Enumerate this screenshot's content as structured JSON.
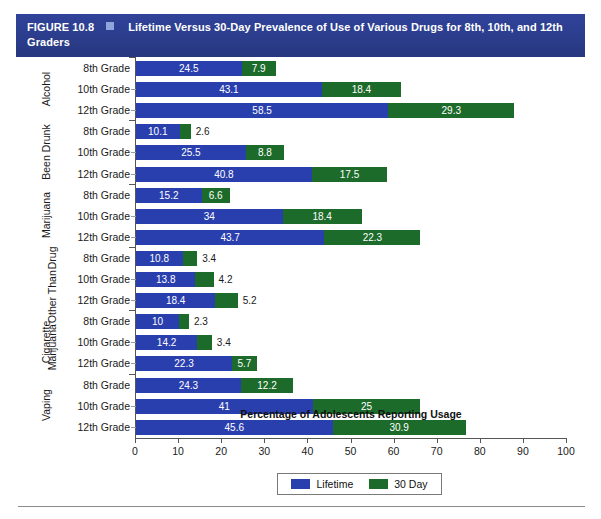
{
  "figure": {
    "number_label": "FIGURE 10.8",
    "title": "Lifetime Versus 30-Day Prevalence of Use of Various Drugs for 8th, 10th, and 12th Graders",
    "header_color": "#2c3f8f",
    "marker_icon": "square-bullet-icon"
  },
  "legend": {
    "position": "bottom-center",
    "items": [
      {
        "label": "Lifetime",
        "color": "#2a3fae"
      },
      {
        "label": "30 Day",
        "color": "#1d6b2a"
      }
    ]
  },
  "axis": {
    "x_title": "Percentage of Adolescents Reporting Usage",
    "x_ticks": [
      "0",
      "10",
      "20",
      "30",
      "40",
      "50",
      "60",
      "70",
      "80",
      "90",
      "100"
    ],
    "x_min": 0,
    "x_max": 100
  },
  "groups": [
    {
      "name": "Alcohol"
    },
    {
      "name": "Been Drunk"
    },
    {
      "name": "Marijuana"
    },
    {
      "name": "Drug Other Than Marijuana",
      "line1": "Drug",
      "line2": "Other Than",
      "line3": "Marijuana"
    },
    {
      "name": "Cigarette"
    },
    {
      "name": "Vaping"
    }
  ],
  "chart_data": {
    "type": "bar",
    "orientation": "horizontal",
    "stacked": true,
    "title": "Lifetime Versus 30-Day Prevalence of Use of Various Drugs for 8th, 10th, and 12th Graders",
    "xlabel": "Percentage of Adolescents Reporting Usage",
    "ylabel": "",
    "xlim": [
      0,
      100
    ],
    "xticks": [
      0,
      10,
      20,
      30,
      40,
      50,
      60,
      70,
      80,
      90,
      100
    ],
    "grid": false,
    "legend": [
      "Lifetime",
      "30 Day"
    ],
    "legend_position": "bottom-center",
    "series": [
      {
        "name": "Lifetime",
        "color": "#2a3fae"
      },
      {
        "name": "30 Day",
        "color": "#1d6b2a"
      }
    ],
    "groups": [
      {
        "group": "Alcohol",
        "rows": [
          {
            "category": "8th Grade",
            "lifetime": 24.5,
            "thirty_day": 7.9
          },
          {
            "category": "10th Grade",
            "lifetime": 43.1,
            "thirty_day": 18.4
          },
          {
            "category": "12th Grade",
            "lifetime": 58.5,
            "thirty_day": 29.3
          }
        ]
      },
      {
        "group": "Been Drunk",
        "rows": [
          {
            "category": "8th Grade",
            "lifetime": 10.1,
            "thirty_day": 2.6
          },
          {
            "category": "10th Grade",
            "lifetime": 25.5,
            "thirty_day": 8.8
          },
          {
            "category": "12th Grade",
            "lifetime": 40.8,
            "thirty_day": 17.5
          }
        ]
      },
      {
        "group": "Marijuana",
        "rows": [
          {
            "category": "8th Grade",
            "lifetime": 15.2,
            "thirty_day": 6.6
          },
          {
            "category": "10th Grade",
            "lifetime": 34,
            "thirty_day": 18.4
          },
          {
            "category": "12th Grade",
            "lifetime": 43.7,
            "thirty_day": 22.3
          }
        ]
      },
      {
        "group": "Drug Other Than Marijuana",
        "rows": [
          {
            "category": "8th Grade",
            "lifetime": 10.8,
            "thirty_day": 3.4
          },
          {
            "category": "10th Grade",
            "lifetime": 13.8,
            "thirty_day": 4.2
          },
          {
            "category": "12th Grade",
            "lifetime": 18.4,
            "thirty_day": 5.2
          }
        ]
      },
      {
        "group": "Cigarette",
        "rows": [
          {
            "category": "8th Grade",
            "lifetime": 10,
            "thirty_day": 2.3
          },
          {
            "category": "10th Grade",
            "lifetime": 14.2,
            "thirty_day": 3.4
          },
          {
            "category": "12th Grade",
            "lifetime": 22.3,
            "thirty_day": 5.7
          }
        ]
      },
      {
        "group": "Vaping",
        "rows": [
          {
            "category": "8th Grade",
            "lifetime": 24.3,
            "thirty_day": 12.2
          },
          {
            "category": "10th Grade",
            "lifetime": 41,
            "thirty_day": 25
          },
          {
            "category": "12th Grade",
            "lifetime": 45.6,
            "thirty_day": 30.9
          }
        ]
      }
    ]
  }
}
